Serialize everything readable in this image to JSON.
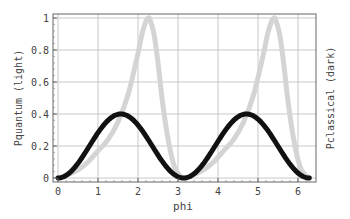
{
  "chart_data": {
    "type": "line",
    "title": "",
    "xlabel": "phi",
    "ylabel_left": "Pquantum (light)",
    "ylabel_right": "Pclassical (dark)",
    "xlim": [
      -0.15,
      6.45
    ],
    "ylim": [
      -0.025,
      1.025
    ],
    "xticks": [
      0,
      1,
      2,
      3,
      4,
      5,
      6
    ],
    "yticks": [
      0,
      0.2,
      0.4,
      0.6,
      0.8,
      1
    ],
    "ytick_labels": [
      "0",
      "0.2",
      "0.4",
      "0.6",
      "0.8",
      "1"
    ],
    "grid": true,
    "series": [
      {
        "name": "Pquantum (light)",
        "color": "#d4d4d4",
        "width": 5,
        "x": [
          0,
          0.25,
          0.5,
          0.75,
          1.0,
          1.25,
          1.5,
          1.75,
          2.0,
          2.1,
          2.2,
          2.25,
          2.3,
          2.4,
          2.5,
          2.6,
          2.7,
          2.8,
          2.9,
          3.0,
          3.1416,
          3.39,
          3.64,
          3.89,
          4.14,
          4.39,
          4.64,
          4.89,
          5.14,
          5.24,
          5.34,
          5.39,
          5.44,
          5.54,
          5.64,
          5.74,
          5.84,
          5.94,
          6.04,
          6.14,
          6.2832
        ],
        "values": [
          0,
          0.02,
          0.05,
          0.1,
          0.17,
          0.24,
          0.35,
          0.52,
          0.78,
          0.9,
          0.98,
          1.0,
          0.99,
          0.9,
          0.72,
          0.5,
          0.32,
          0.18,
          0.08,
          0.03,
          0,
          0.02,
          0.05,
          0.1,
          0.17,
          0.24,
          0.35,
          0.52,
          0.78,
          0.9,
          0.98,
          1.0,
          0.99,
          0.9,
          0.72,
          0.5,
          0.32,
          0.18,
          0.08,
          0.03,
          0
        ]
      },
      {
        "name": "Pclassical (dark)",
        "color": "#111111",
        "width": 5,
        "function": "0.4*sin(phi)^2",
        "x_range": [
          0,
          6.2832
        ],
        "peak": 0.4
      }
    ]
  }
}
